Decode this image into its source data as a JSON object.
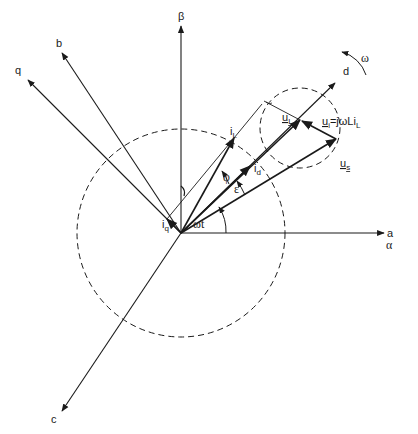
{
  "diagram": {
    "type": "space-vector phasor diagram",
    "axes": {
      "alpha_label": "α",
      "a_label": "a",
      "beta_label": "β",
      "b_label": "b",
      "c_label": "c",
      "d_label": "d",
      "q_label": "q"
    },
    "rotation_label": "ω",
    "vectors": {
      "current_label": "i",
      "current_sub": "L",
      "id_label": "i",
      "id_sub": "d",
      "iq_label": "i",
      "iq_sub": "q",
      "uL_label": "u",
      "uL_sub": "L",
      "us_label": "u",
      "us_sub": "s",
      "ui_equation": "u",
      "ui_sub": "i",
      "ui_rhs": "=jωLi",
      "ui_rhs_sub": "L"
    },
    "angles": {
      "phi": "φ",
      "epsilon": "ε",
      "omega_t": "ωt"
    },
    "colors": {
      "line": "#1a1a1a",
      "background": "#ffffff"
    }
  }
}
